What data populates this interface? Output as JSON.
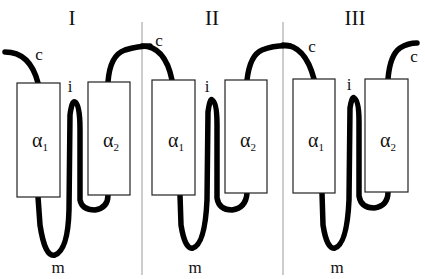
{
  "figure": {
    "colors": {
      "chain": "#000000",
      "box_stroke": "#222222",
      "divider": "#9a9a9a",
      "background": "#ffffff"
    },
    "panels": [
      {
        "roman": "I",
        "helix1": {
          "symbol": "α",
          "sub": "1"
        },
        "helix2": {
          "symbol": "α",
          "sub": "2"
        },
        "labels": {
          "c": "c",
          "i": "i",
          "m": "m"
        }
      },
      {
        "roman": "II",
        "helix1": {
          "symbol": "α",
          "sub": "1"
        },
        "helix2": {
          "symbol": "α",
          "sub": "2"
        },
        "labels": {
          "c": "c",
          "i": "i",
          "m": "m"
        }
      },
      {
        "roman": "III",
        "helix1": {
          "symbol": "α",
          "sub": "1"
        },
        "helix2": {
          "symbol": "α",
          "sub": "2"
        },
        "labels": {
          "c": "c",
          "c2": "c",
          "i": "i",
          "m": "m"
        }
      }
    ]
  }
}
